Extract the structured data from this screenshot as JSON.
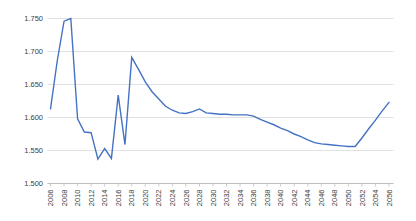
{
  "chart_style": {
    "background": "#ffffff",
    "series_color": "#4472C4",
    "gridline_color": "#d9d9d9",
    "axis_line_color": "#bfbfbf",
    "tick_color": "#bfbfbf",
    "label_color": "#404040"
  },
  "chart_data": {
    "type": "line",
    "title": "",
    "xlabel": "",
    "ylabel": "",
    "legend": "none",
    "grid": "horizontal",
    "ylim": [
      1.5,
      1.75
    ],
    "ytick_step": 0.05,
    "ytick_labels": [
      "1.750",
      "1.700",
      "1.650",
      "1.600",
      "1.550",
      "1.500"
    ],
    "xtick_labels": [
      "2006",
      "2008",
      "2010",
      "2012",
      "2014",
      "2016",
      "2018",
      "2020",
      "2022",
      "2024",
      "2026",
      "2028",
      "2030",
      "2032",
      "2034",
      "2036",
      "2038",
      "2040",
      "2042",
      "2044",
      "2046",
      "2048",
      "2050",
      "2052",
      "2054",
      "2056"
    ],
    "x": [
      2006,
      2007,
      2008,
      2009,
      2010,
      2011,
      2012,
      2013,
      2014,
      2015,
      2016,
      2017,
      2018,
      2019,
      2020,
      2021,
      2022,
      2023,
      2024,
      2025,
      2026,
      2027,
      2028,
      2029,
      2030,
      2031,
      2032,
      2033,
      2034,
      2035,
      2036,
      2037,
      2038,
      2039,
      2040,
      2041,
      2042,
      2043,
      2044,
      2045,
      2046,
      2047,
      2048,
      2049,
      2050,
      2051,
      2052,
      2053,
      2054,
      2055,
      2056
    ],
    "values": [
      1.613,
      1.686,
      1.746,
      1.75,
      1.598,
      1.578,
      1.577,
      1.537,
      1.553,
      1.538,
      1.634,
      1.559,
      1.691,
      1.673,
      1.654,
      1.639,
      1.628,
      1.617,
      1.611,
      1.607,
      1.606,
      1.609,
      1.613,
      1.607,
      1.606,
      1.605,
      1.605,
      1.604,
      1.604,
      1.604,
      1.602,
      1.597,
      1.593,
      1.589,
      1.584,
      1.58,
      1.575,
      1.571,
      1.566,
      1.562,
      1.56,
      1.559,
      1.558,
      1.557,
      1.556,
      1.556,
      1.569,
      1.583,
      1.596,
      1.61,
      1.623
    ]
  }
}
